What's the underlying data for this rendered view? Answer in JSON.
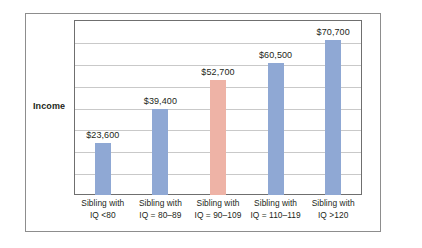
{
  "figure": {
    "axis_title": "Income",
    "frame_color": "#8d8d8d",
    "plot_border_color": "#6f6f6f",
    "gridline_color": "#c9c9c9",
    "background": "#ffffff"
  },
  "chart_data": {
    "type": "bar",
    "title": "",
    "xlabel": "",
    "ylabel": "Income",
    "ylim": [
      0,
      80000
    ],
    "grid": true,
    "gridline_interval": 10000,
    "gridline_count": 8,
    "legend": "none",
    "categories": [
      "Sibling with IQ <80",
      "Sibling with IQ = 80–89",
      "Sibling with IQ = 90–109",
      "Sibling with IQ = 110–119",
      "Sibling with IQ >120"
    ],
    "category_lines": [
      {
        "line1": "Sibling with",
        "line2": "IQ <80"
      },
      {
        "line1": "Sibling with",
        "line2": "IQ = 80–89"
      },
      {
        "line1": "Sibling with",
        "line2": "IQ = 90–109"
      },
      {
        "line1": "Sibling with",
        "line2": "IQ = 110–119"
      },
      {
        "line1": "Sibling with",
        "line2": "IQ >120"
      }
    ],
    "values": [
      23600,
      39400,
      52700,
      60500,
      70700
    ],
    "value_labels": [
      "$23,600",
      "$39,400",
      "$52,700",
      "$60,500",
      "$70,700"
    ],
    "bar_colors": [
      "#8fa8d4",
      "#8fa8d4",
      "#eeb3a6",
      "#8fa8d4",
      "#8fa8d4"
    ],
    "series": [
      {
        "name": "Income",
        "values": [
          23600,
          39400,
          52700,
          60500,
          70700
        ]
      }
    ]
  }
}
